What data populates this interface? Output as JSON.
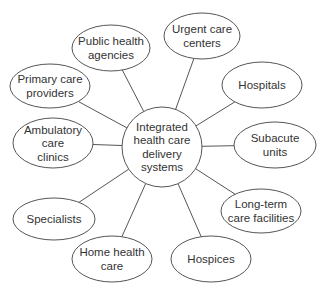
{
  "diagram": {
    "type": "hub-and-spoke",
    "hub": {
      "lines": [
        "Integrated",
        "health care",
        "delivery",
        "systems"
      ],
      "cx": 162,
      "cy": 147,
      "r": 40
    },
    "nodes": [
      {
        "id": "public-health-agencies",
        "lines": [
          "Public health",
          "agencies"
        ],
        "cx": 111,
        "cy": 48,
        "rx": 39,
        "ry": 23
      },
      {
        "id": "urgent-care-centers",
        "lines": [
          "Urgent care",
          "centers"
        ],
        "cx": 202,
        "cy": 36,
        "rx": 38,
        "ry": 23
      },
      {
        "id": "primary-care-providers",
        "lines": [
          "Primary care",
          "providers"
        ],
        "cx": 50,
        "cy": 86,
        "rx": 40,
        "ry": 22
      },
      {
        "id": "hospitals",
        "lines": [
          "Hospitals"
        ],
        "cx": 262,
        "cy": 85,
        "rx": 40,
        "ry": 23
      },
      {
        "id": "ambulatory-care-clinics",
        "lines": [
          "Ambulatory",
          "care",
          "clinics"
        ],
        "cx": 53,
        "cy": 143,
        "rx": 40,
        "ry": 25
      },
      {
        "id": "subacute-units",
        "lines": [
          "Subacute",
          "units"
        ],
        "cx": 275,
        "cy": 145,
        "rx": 41,
        "ry": 23
      },
      {
        "id": "specialists",
        "lines": [
          "Specialists"
        ],
        "cx": 54,
        "cy": 219,
        "rx": 41,
        "ry": 21
      },
      {
        "id": "long-term-care-facilities",
        "lines": [
          "Long-term",
          "care facilities"
        ],
        "cx": 261,
        "cy": 211,
        "rx": 40,
        "ry": 22
      },
      {
        "id": "home-health-care",
        "lines": [
          "Home health",
          "care"
        ],
        "cx": 112,
        "cy": 259,
        "rx": 40,
        "ry": 23
      },
      {
        "id": "hospices",
        "lines": [
          "Hospices"
        ],
        "cx": 211,
        "cy": 259,
        "rx": 40,
        "ry": 23
      }
    ],
    "colors": {
      "stroke": "#555555",
      "text": "#333333",
      "background": "#ffffff"
    }
  }
}
